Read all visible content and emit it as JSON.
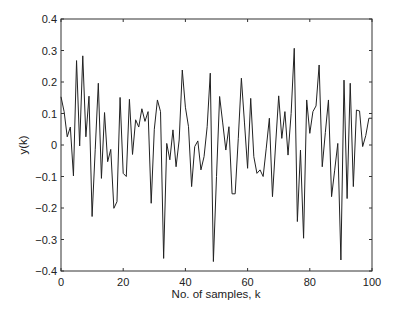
{
  "chart_data": {
    "type": "line",
    "title": "",
    "xlabel": "No. of samples, k",
    "ylabel": "y(k)",
    "xlim": [
      0,
      100
    ],
    "ylim": [
      -0.4,
      0.4
    ],
    "grid": false,
    "legend": null,
    "xticks": [
      0,
      20,
      40,
      60,
      80,
      100
    ],
    "yticks": [
      -0.4,
      -0.3,
      -0.2,
      -0.1,
      0,
      0.1,
      0.2,
      0.3,
      0.4
    ],
    "xtick_labels": [
      "0",
      "20",
      "40",
      "60",
      "80",
      "100"
    ],
    "ytick_labels": [
      "−0.4",
      "−0.3",
      "−0.2",
      "−0.1",
      "0",
      "0.1",
      "0.2",
      "0.3",
      "0.4"
    ],
    "series": [
      {
        "name": "y(k)",
        "color": "#222222",
        "x": [
          0,
          1,
          2,
          3,
          4,
          5,
          6,
          7,
          8,
          9,
          10,
          11,
          12,
          13,
          14,
          15,
          16,
          17,
          18,
          19,
          20,
          21,
          22,
          23,
          24,
          25,
          26,
          27,
          28,
          29,
          30,
          31,
          32,
          33,
          34,
          35,
          36,
          37,
          38,
          39,
          40,
          41,
          42,
          43,
          44,
          45,
          46,
          47,
          48,
          49,
          50,
          51,
          52,
          53,
          54,
          55,
          56,
          57,
          58,
          59,
          60,
          61,
          62,
          63,
          64,
          65,
          66,
          67,
          68,
          69,
          70,
          71,
          72,
          73,
          74,
          75,
          76,
          77,
          78,
          79,
          80,
          81,
          82,
          83,
          84,
          85,
          86,
          87,
          88,
          89,
          90,
          91,
          92,
          93,
          94,
          95,
          96,
          97,
          98,
          99,
          100
        ],
        "values": [
          0.153,
          0.106,
          0.026,
          0.057,
          -0.098,
          0.268,
          -0.003,
          0.283,
          0.026,
          0.155,
          -0.227,
          -0.015,
          0.196,
          -0.106,
          0.103,
          -0.053,
          -0.014,
          -0.201,
          -0.18,
          0.151,
          -0.09,
          -0.1,
          0.145,
          -0.03,
          0.08,
          0.057,
          0.115,
          0.075,
          0.106,
          -0.185,
          0.05,
          0.143,
          0.106,
          -0.36,
          0.005,
          -0.047,
          0.048,
          -0.069,
          0.016,
          0.238,
          0.12,
          0.058,
          -0.132,
          -0.005,
          0.013,
          -0.079,
          -0.037,
          0.058,
          0.228,
          -0.37,
          -0.1,
          0.154,
          0.07,
          -0.016,
          0.058,
          -0.155,
          -0.155,
          0.02,
          0.212,
          0.07,
          -0.074,
          0.148,
          -0.037,
          -0.09,
          -0.079,
          -0.1,
          -0.01,
          0.085,
          -0.164,
          0.0,
          0.156,
          0.021,
          0.106,
          -0.032,
          0.1,
          0.307,
          -0.243,
          -0.016,
          -0.296,
          0.143,
          0.037,
          0.106,
          0.124,
          0.254,
          -0.069,
          0.04,
          0.143,
          -0.164,
          -0.08,
          0.005,
          -0.365,
          0.206,
          -0.17,
          0.196,
          -0.132,
          0.111,
          0.108,
          -0.005,
          0.03,
          0.085,
          0.085
        ]
      }
    ]
  }
}
